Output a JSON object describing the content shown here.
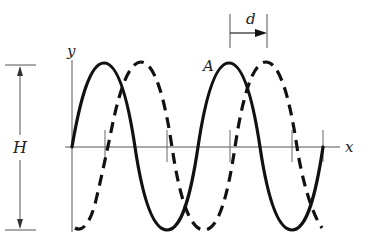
{
  "diagram": {
    "type": "wave-displacement",
    "labels": {
      "y_axis": "y",
      "x_axis": "x",
      "height": "H",
      "peak": "A",
      "shift": "d"
    },
    "curves": [
      {
        "name": "original-wave",
        "style": "solid"
      },
      {
        "name": "shifted-wave",
        "style": "dashed",
        "shift": "d"
      }
    ],
    "colors": {
      "ink": "#111111",
      "axis": "#555555",
      "background": "#ffffff"
    }
  }
}
